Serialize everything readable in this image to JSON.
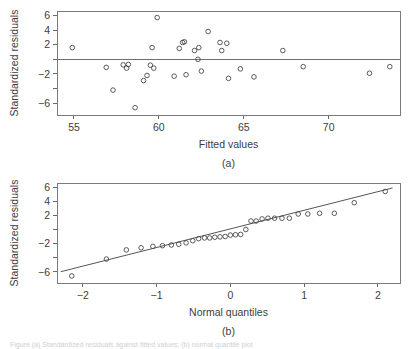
{
  "figure": {
    "bottom_caption_partial": "Figure  (a) Standardized residuals against fitted values; (b) normal quantile plot"
  },
  "chart_data": [
    {
      "type": "scatter",
      "panel_label": "(a)",
      "title": "",
      "xlabel": "Fitted values",
      "ylabel": "Standardized residuals",
      "xlim": [
        54.0,
        74.2
      ],
      "ylim": [
        -7.6,
        6.6
      ],
      "xticks": [
        55,
        60,
        65,
        70
      ],
      "yticks": [
        6,
        4,
        2,
        -2,
        -6
      ],
      "ytick_labels": [
        "6",
        "4",
        "2",
        "-2",
        "-6"
      ],
      "grid": false,
      "legend": "none",
      "reference_line": {
        "type": "horizontal",
        "y": 0
      },
      "x": [
        54.9,
        56.9,
        57.3,
        57.9,
        58.1,
        58.2,
        58.6,
        59.1,
        59.3,
        59.5,
        59.6,
        59.7,
        59.9,
        60.9,
        61.2,
        61.4,
        61.5,
        61.6,
        62.1,
        62.3,
        62.35,
        62.5,
        62.9,
        63.6,
        63.7,
        64.0,
        64.1,
        64.8,
        65.6,
        67.3,
        68.5,
        72.4,
        73.6
      ],
      "y": [
        1.6,
        -1.1,
        -4.2,
        -0.75,
        -1.2,
        -0.7,
        -6.6,
        -2.9,
        -2.2,
        -0.8,
        1.6,
        -1.2,
        5.7,
        -2.3,
        1.5,
        2.3,
        2.4,
        -2.1,
        1.2,
        0.0,
        1.6,
        -1.6,
        3.8,
        2.3,
        1.2,
        2.2,
        -2.6,
        -1.3,
        -2.4,
        1.2,
        -1.0,
        -1.9,
        -1.0
      ]
    },
    {
      "type": "scatter",
      "panel_label": "(b)",
      "title": "",
      "xlabel": "Normal quantiles",
      "ylabel": "Standardized residuals",
      "xlim": [
        -2.35,
        2.3
      ],
      "ylim": [
        -7.6,
        6.6
      ],
      "xticks": [
        -2,
        -1,
        0,
        1,
        2
      ],
      "xtick_labels": [
        "-2",
        "-1",
        "0",
        "1",
        "2"
      ],
      "yticks": [
        6,
        4,
        2,
        -2,
        -6
      ],
      "ytick_labels": [
        "6",
        "4",
        "2",
        "-2",
        "-6"
      ],
      "grid": false,
      "legend": "none",
      "reference_line": {
        "type": "qq",
        "x1": -2.3,
        "y1": -6.0,
        "x2": 2.2,
        "y2": 5.9
      },
      "x": [
        -2.15,
        -1.68,
        -1.41,
        -1.21,
        -1.05,
        -0.92,
        -0.8,
        -0.7,
        -0.6,
        -0.51,
        -0.43,
        -0.35,
        -0.28,
        -0.21,
        -0.14,
        -0.07,
        0.0,
        0.07,
        0.14,
        0.21,
        0.28,
        0.35,
        0.43,
        0.51,
        0.6,
        0.7,
        0.8,
        0.92,
        1.05,
        1.21,
        1.41,
        1.68,
        2.1
      ],
      "y": [
        -6.6,
        -4.2,
        -2.9,
        -2.6,
        -2.4,
        -2.3,
        -2.2,
        -2.1,
        -1.9,
        -1.6,
        -1.3,
        -1.2,
        -1.2,
        -1.1,
        -1.05,
        -1.0,
        -0.8,
        -0.75,
        -0.7,
        0.0,
        1.2,
        1.2,
        1.5,
        1.6,
        1.6,
        1.6,
        1.6,
        2.2,
        2.2,
        2.3,
        2.3,
        3.8,
        5.4
      ]
    }
  ]
}
